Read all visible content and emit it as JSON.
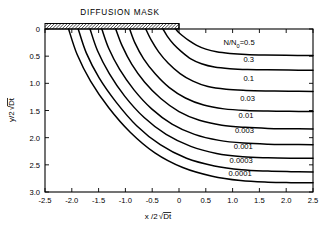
{
  "figure": {
    "mask_label": "DIFFUSION MASK",
    "series_prefix": "N/N",
    "series_prefix_sub": "0",
    "series_prefix_eq": "="
  },
  "chart_data": {
    "type": "line",
    "title": "",
    "subtitle": "",
    "annotations": [
      "DIFFUSION MASK"
    ],
    "xlabel": "x/2√Dt",
    "ylabel": "y/2√Dt",
    "xlabel_parts": {
      "lead": "x /2",
      "radical": "√",
      "under": "Dt"
    },
    "ylabel_parts": {
      "lead": "y/2",
      "radical": "√",
      "under": "Dt"
    },
    "xlim": [
      -2.5,
      2.5
    ],
    "ylim": [
      3.0,
      0.0
    ],
    "y_axis_inverted": true,
    "grid": false,
    "legend": "inline-curve-labels",
    "xticks": [
      -2.5,
      -2.0,
      -1.5,
      -1.0,
      -0.5,
      0,
      0.5,
      1.0,
      1.5,
      2.0,
      2.5
    ],
    "xticklabels": [
      "-2.5",
      "-2.0",
      "-1.5",
      "-1.0",
      "-0.5",
      "0",
      "0.5",
      "1.0",
      "1.5",
      "2.0",
      "2.5"
    ],
    "yticks": [
      0,
      0.5,
      1.0,
      1.5,
      2.0,
      2.5,
      3.0
    ],
    "yticklabels": [
      "0",
      "0.5",
      "1.0",
      "1.5",
      "2.0",
      "2.5",
      "3.0"
    ],
    "mask": {
      "x_start": -2.5,
      "x_end": 0.0,
      "y": 0.0,
      "hatched": true
    },
    "series": [
      {
        "name": "0.5",
        "label": "N/N0=0.5",
        "value": 0.5,
        "label_x": 1.12,
        "label_y": 0.3,
        "x": [
          -0.06,
          -0.02,
          0.06,
          0.18,
          0.33,
          0.5,
          0.7,
          0.95,
          1.25,
          1.6,
          2.0,
          2.5
        ],
        "y": [
          0.0,
          0.05,
          0.12,
          0.21,
          0.3,
          0.37,
          0.42,
          0.45,
          0.47,
          0.48,
          0.485,
          0.49
        ]
      },
      {
        "name": "0.3",
        "label": "0.3",
        "value": 0.3,
        "label_x": 1.3,
        "label_y": 0.6,
        "x": [
          -0.3,
          -0.22,
          -0.1,
          0.05,
          0.22,
          0.42,
          0.66,
          0.95,
          1.28,
          1.65,
          2.05,
          2.5
        ],
        "y": [
          0.0,
          0.13,
          0.28,
          0.42,
          0.55,
          0.64,
          0.7,
          0.73,
          0.745,
          0.75,
          0.755,
          0.76
        ]
      },
      {
        "name": "0.1",
        "label": "0.1",
        "value": 0.1,
        "label_x": 1.3,
        "label_y": 0.96,
        "x": [
          -0.62,
          -0.52,
          -0.38,
          -0.2,
          0.02,
          0.26,
          0.54,
          0.88,
          1.25,
          1.65,
          2.05,
          2.5
        ],
        "y": [
          0.0,
          0.2,
          0.42,
          0.63,
          0.82,
          0.96,
          1.06,
          1.11,
          1.13,
          1.14,
          1.145,
          1.15
        ]
      },
      {
        "name": "0.03",
        "label": "0.03",
        "value": 0.03,
        "label_x": 1.28,
        "label_y": 1.33,
        "x": [
          -0.92,
          -0.82,
          -0.66,
          -0.44,
          -0.18,
          0.12,
          0.46,
          0.84,
          1.25,
          1.66,
          2.06,
          2.5
        ],
        "y": [
          0.0,
          0.26,
          0.55,
          0.83,
          1.08,
          1.27,
          1.4,
          1.47,
          1.5,
          1.51,
          1.515,
          1.52
        ]
      },
      {
        "name": "0.01",
        "label": "0.01",
        "value": 0.01,
        "label_x": 1.25,
        "label_y": 1.63,
        "x": [
          -1.18,
          -1.06,
          -0.88,
          -0.64,
          -0.34,
          0.0,
          0.38,
          0.8,
          1.23,
          1.66,
          2.07,
          2.5
        ],
        "y": [
          0.0,
          0.31,
          0.65,
          0.98,
          1.28,
          1.52,
          1.68,
          1.77,
          1.81,
          1.83,
          1.835,
          1.84
        ]
      },
      {
        "name": "0.003",
        "label": "0.003",
        "value": 0.003,
        "label_x": 1.22,
        "label_y": 1.92,
        "x": [
          -1.44,
          -1.31,
          -1.11,
          -0.84,
          -0.51,
          -0.13,
          0.29,
          0.75,
          1.21,
          1.66,
          2.08,
          2.5
        ],
        "y": [
          0.0,
          0.36,
          0.74,
          1.12,
          1.47,
          1.75,
          1.94,
          2.05,
          2.1,
          2.12,
          2.125,
          2.13
        ]
      },
      {
        "name": "0.001",
        "label": "0.001",
        "value": 0.001,
        "label_x": 1.2,
        "label_y": 2.2,
        "x": [
          -1.66,
          -1.52,
          -1.3,
          -1.01,
          -0.65,
          -0.24,
          0.22,
          0.7,
          1.19,
          1.66,
          2.08,
          2.5
        ],
        "y": [
          0.0,
          0.4,
          0.82,
          1.24,
          1.63,
          1.94,
          2.16,
          2.29,
          2.35,
          2.37,
          2.378,
          2.38
        ]
      },
      {
        "name": "0.0003",
        "label": "0.0003",
        "value": 0.0003,
        "label_x": 1.16,
        "label_y": 2.46,
        "x": [
          -1.88,
          -1.73,
          -1.49,
          -1.17,
          -0.79,
          -0.35,
          0.14,
          0.66,
          1.17,
          1.66,
          2.09,
          2.5
        ],
        "y": [
          0.0,
          0.44,
          0.9,
          1.35,
          1.78,
          2.13,
          2.38,
          2.52,
          2.59,
          2.615,
          2.625,
          2.63
        ]
      },
      {
        "name": "0.0001",
        "label": "0.0001",
        "value": 0.0001,
        "label_x": 1.14,
        "label_y": 2.7,
        "x": [
          -2.06,
          -1.9,
          -1.65,
          -1.31,
          -0.91,
          -0.45,
          0.07,
          0.62,
          1.15,
          1.66,
          2.09,
          2.5
        ],
        "y": [
          0.0,
          0.47,
          0.96,
          1.45,
          1.9,
          2.28,
          2.55,
          2.71,
          2.79,
          2.82,
          2.828,
          2.83
        ]
      }
    ]
  }
}
